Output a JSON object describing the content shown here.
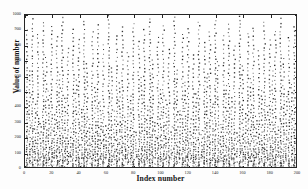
{
  "chart_data": {
    "type": "scatter",
    "title": "",
    "xlabel": "Index number",
    "ylabel": "Value of number",
    "xlim": [
      0,
      200
    ],
    "ylim": [
      0,
      1000
    ],
    "grid": false,
    "legend": null,
    "marker": "dot",
    "marker_color": "#333333",
    "xticks": [
      0,
      20,
      40,
      60,
      80,
      100,
      120,
      140,
      160,
      180,
      200
    ],
    "xticklabels": [
      "0",
      "20",
      "40",
      "60",
      "80",
      "100",
      "120",
      "140",
      "160",
      "180",
      "200"
    ],
    "yticks": [
      0,
      100,
      200,
      300,
      400,
      500,
      600,
      700,
      800,
      900,
      1000
    ],
    "yticklabels": [
      "0",
      "100",
      "200",
      "300",
      "400",
      "500",
      "600",
      "700",
      "800",
      "900",
      "1000"
    ],
    "columns": [
      {
        "x": 1,
        "top": 905,
        "bottom": 30,
        "n": 46
      },
      {
        "x": 3,
        "top": 640,
        "bottom": 55,
        "n": 29
      },
      {
        "x": 5,
        "top": 975,
        "bottom": 20,
        "n": 52
      },
      {
        "x": 7,
        "top": 420,
        "bottom": 60,
        "n": 19
      },
      {
        "x": 9,
        "top": 880,
        "bottom": 35,
        "n": 44
      },
      {
        "x": 11,
        "top": 300,
        "bottom": 70,
        "n": 13
      },
      {
        "x": 13,
        "top": 955,
        "bottom": 25,
        "n": 50
      },
      {
        "x": 15,
        "top": 725,
        "bottom": 45,
        "n": 34
      },
      {
        "x": 17,
        "top": 505,
        "bottom": 65,
        "n": 23
      },
      {
        "x": 19,
        "top": 930,
        "bottom": 28,
        "n": 47
      },
      {
        "x": 21,
        "top": 355,
        "bottom": 75,
        "n": 15
      },
      {
        "x": 23,
        "top": 860,
        "bottom": 32,
        "n": 42
      },
      {
        "x": 25,
        "top": 615,
        "bottom": 52,
        "n": 28
      },
      {
        "x": 27,
        "top": 985,
        "bottom": 18,
        "n": 54
      },
      {
        "x": 29,
        "top": 460,
        "bottom": 62,
        "n": 21
      },
      {
        "x": 31,
        "top": 790,
        "bottom": 40,
        "n": 38
      },
      {
        "x": 33,
        "top": 265,
        "bottom": 80,
        "n": 11
      },
      {
        "x": 35,
        "top": 915,
        "bottom": 26,
        "n": 46
      },
      {
        "x": 37,
        "top": 580,
        "bottom": 58,
        "n": 26
      },
      {
        "x": 39,
        "top": 845,
        "bottom": 33,
        "n": 41
      },
      {
        "x": 41,
        "top": 395,
        "bottom": 68,
        "n": 17
      },
      {
        "x": 43,
        "top": 965,
        "bottom": 22,
        "n": 51
      },
      {
        "x": 45,
        "top": 690,
        "bottom": 48,
        "n": 32
      },
      {
        "x": 47,
        "top": 320,
        "bottom": 72,
        "n": 14
      },
      {
        "x": 49,
        "top": 890,
        "bottom": 30,
        "n": 44
      },
      {
        "x": 51,
        "top": 535,
        "bottom": 60,
        "n": 24
      },
      {
        "x": 53,
        "top": 940,
        "bottom": 24,
        "n": 48
      },
      {
        "x": 55,
        "top": 440,
        "bottom": 66,
        "n": 20
      },
      {
        "x": 57,
        "top": 810,
        "bottom": 38,
        "n": 39
      },
      {
        "x": 59,
        "top": 285,
        "bottom": 78,
        "n": 12
      },
      {
        "x": 61,
        "top": 995,
        "bottom": 16,
        "n": 55
      },
      {
        "x": 63,
        "top": 660,
        "bottom": 50,
        "n": 31
      },
      {
        "x": 65,
        "top": 375,
        "bottom": 70,
        "n": 16
      },
      {
        "x": 67,
        "top": 870,
        "bottom": 31,
        "n": 43
      },
      {
        "x": 69,
        "top": 560,
        "bottom": 57,
        "n": 25
      },
      {
        "x": 71,
        "top": 925,
        "bottom": 27,
        "n": 47
      },
      {
        "x": 73,
        "top": 340,
        "bottom": 74,
        "n": 15
      },
      {
        "x": 75,
        "top": 760,
        "bottom": 42,
        "n": 36
      },
      {
        "x": 77,
        "top": 480,
        "bottom": 63,
        "n": 22
      },
      {
        "x": 79,
        "top": 950,
        "bottom": 23,
        "n": 49
      },
      {
        "x": 81,
        "top": 245,
        "bottom": 82,
        "n": 10
      },
      {
        "x": 83,
        "top": 835,
        "bottom": 34,
        "n": 40
      },
      {
        "x": 85,
        "top": 600,
        "bottom": 54,
        "n": 27
      },
      {
        "x": 87,
        "top": 905,
        "bottom": 29,
        "n": 45
      },
      {
        "x": 89,
        "top": 410,
        "bottom": 67,
        "n": 18
      },
      {
        "x": 91,
        "top": 980,
        "bottom": 19,
        "n": 53
      },
      {
        "x": 93,
        "top": 710,
        "bottom": 46,
        "n": 33
      },
      {
        "x": 95,
        "top": 310,
        "bottom": 76,
        "n": 13
      },
      {
        "x": 97,
        "top": 855,
        "bottom": 32,
        "n": 42
      },
      {
        "x": 99,
        "top": 520,
        "bottom": 61,
        "n": 23
      },
      {
        "x": 101,
        "top": 935,
        "bottom": 25,
        "n": 48
      },
      {
        "x": 103,
        "top": 450,
        "bottom": 64,
        "n": 20
      },
      {
        "x": 105,
        "top": 780,
        "bottom": 41,
        "n": 37
      },
      {
        "x": 107,
        "top": 275,
        "bottom": 79,
        "n": 11
      },
      {
        "x": 109,
        "top": 990,
        "bottom": 17,
        "n": 54
      },
      {
        "x": 111,
        "top": 650,
        "bottom": 51,
        "n": 30
      },
      {
        "x": 113,
        "top": 385,
        "bottom": 69,
        "n": 17
      },
      {
        "x": 115,
        "top": 880,
        "bottom": 30,
        "n": 44
      },
      {
        "x": 117,
        "top": 570,
        "bottom": 56,
        "n": 26
      },
      {
        "x": 119,
        "top": 915,
        "bottom": 28,
        "n": 46
      },
      {
        "x": 121,
        "top": 330,
        "bottom": 73,
        "n": 14
      },
      {
        "x": 123,
        "top": 745,
        "bottom": 43,
        "n": 35
      },
      {
        "x": 125,
        "top": 495,
        "bottom": 62,
        "n": 22
      },
      {
        "x": 127,
        "top": 960,
        "bottom": 21,
        "n": 50
      },
      {
        "x": 129,
        "top": 255,
        "bottom": 81,
        "n": 10
      },
      {
        "x": 131,
        "top": 825,
        "bottom": 36,
        "n": 40
      },
      {
        "x": 133,
        "top": 625,
        "bottom": 53,
        "n": 29
      },
      {
        "x": 135,
        "top": 895,
        "bottom": 29,
        "n": 45
      },
      {
        "x": 137,
        "top": 430,
        "bottom": 65,
        "n": 19
      },
      {
        "x": 139,
        "top": 970,
        "bottom": 20,
        "n": 52
      },
      {
        "x": 141,
        "top": 700,
        "bottom": 47,
        "n": 33
      },
      {
        "x": 143,
        "top": 295,
        "bottom": 77,
        "n": 12
      },
      {
        "x": 145,
        "top": 865,
        "bottom": 31,
        "n": 43
      },
      {
        "x": 147,
        "top": 545,
        "bottom": 59,
        "n": 25
      },
      {
        "x": 149,
        "top": 945,
        "bottom": 24,
        "n": 49
      },
      {
        "x": 151,
        "top": 465,
        "bottom": 64,
        "n": 21
      },
      {
        "x": 153,
        "top": 800,
        "bottom": 39,
        "n": 38
      },
      {
        "x": 155,
        "top": 235,
        "bottom": 83,
        "n": 9
      },
      {
        "x": 157,
        "top": 998,
        "bottom": 15,
        "n": 56
      },
      {
        "x": 159,
        "top": 670,
        "bottom": 49,
        "n": 31
      },
      {
        "x": 161,
        "top": 365,
        "bottom": 71,
        "n": 16
      },
      {
        "x": 163,
        "top": 885,
        "bottom": 30,
        "n": 44
      },
      {
        "x": 165,
        "top": 590,
        "bottom": 55,
        "n": 27
      },
      {
        "x": 167,
        "top": 922,
        "bottom": 27,
        "n": 47
      },
      {
        "x": 169,
        "top": 345,
        "bottom": 74,
        "n": 15
      },
      {
        "x": 171,
        "top": 770,
        "bottom": 42,
        "n": 36
      },
      {
        "x": 173,
        "top": 512,
        "bottom": 60,
        "n": 23
      },
      {
        "x": 175,
        "top": 955,
        "bottom": 22,
        "n": 50
      },
      {
        "x": 177,
        "top": 405,
        "bottom": 68,
        "n": 18
      },
      {
        "x": 179,
        "top": 840,
        "bottom": 34,
        "n": 41
      },
      {
        "x": 181,
        "top": 635,
        "bottom": 52,
        "n": 29
      },
      {
        "x": 183,
        "top": 900,
        "bottom": 29,
        "n": 45
      },
      {
        "x": 185,
        "top": 280,
        "bottom": 78,
        "n": 12
      },
      {
        "x": 187,
        "top": 978,
        "bottom": 19,
        "n": 53
      },
      {
        "x": 189,
        "top": 718,
        "bottom": 46,
        "n": 34
      },
      {
        "x": 191,
        "top": 470,
        "bottom": 63,
        "n": 21
      },
      {
        "x": 193,
        "top": 860,
        "bottom": 32,
        "n": 42
      },
      {
        "x": 195,
        "top": 555,
        "bottom": 58,
        "n": 25
      },
      {
        "x": 197,
        "top": 930,
        "bottom": 26,
        "n": 47
      },
      {
        "x": 199,
        "top": 690,
        "bottom": 48,
        "n": 32
      }
    ]
  }
}
